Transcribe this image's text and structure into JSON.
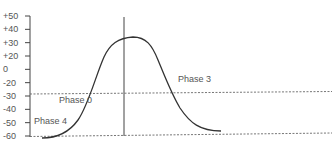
{
  "chart_data": {
    "type": "line",
    "title": "",
    "xlabel": "",
    "ylabel": "",
    "ylim": [
      -60,
      50
    ],
    "grid": false,
    "y_ticks": [
      "+50",
      "+40",
      "+30",
      "+20",
      "0",
      "-20",
      "-30",
      "-40",
      "-50",
      "-60"
    ],
    "series": [
      {
        "name": "action potential",
        "x": [
          0,
          5,
          10,
          15,
          20,
          25,
          30,
          35,
          40,
          45,
          50,
          55,
          60,
          65,
          70,
          75,
          80,
          85,
          90,
          95,
          100
        ],
        "values": [
          -61,
          -61,
          -60,
          -57,
          -50,
          -38,
          -20,
          0,
          20,
          30,
          33,
          32,
          25,
          10,
          -10,
          -28,
          -42,
          -52,
          -57,
          -58,
          -58
        ]
      }
    ],
    "reference_lines": [
      {
        "type": "dashed-horizontal",
        "value": -30
      },
      {
        "type": "dashed-horizontal",
        "value": -60
      },
      {
        "type": "solid-vertical",
        "description": "vertical marker at peak"
      }
    ],
    "annotations": [
      {
        "text": "Phase 0",
        "y": -35
      },
      {
        "text": "Phase 3",
        "y": -18
      },
      {
        "text": "Phase 4",
        "y": -47
      }
    ]
  },
  "labels": {
    "phase0": "Phase 0",
    "phase3": "Phase 3",
    "phase4": "Phase 4"
  },
  "colors": {
    "curve": "#333333",
    "axis": "#444444",
    "text": "#555555",
    "dashed": "#666666"
  }
}
